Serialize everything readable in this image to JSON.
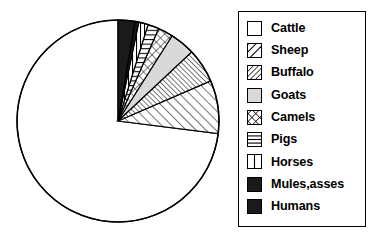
{
  "chart_data": {
    "type": "pie",
    "title": "",
    "subtitle": "",
    "xlabel": "",
    "ylabel": "",
    "grid": false,
    "legend_position": "right",
    "start_angle_deg": 90,
    "direction": "counterclockwise",
    "categories": [
      "Cattle",
      "Sheep",
      "Buffalo",
      "Goats",
      "Camels",
      "Pigs",
      "Horses",
      "Mules,asses",
      "Humans"
    ],
    "values": [
      73.0,
      8.5,
      5.5,
      4.0,
      2.4,
      1.8,
      1.5,
      0.6,
      2.7
    ],
    "units": "percent",
    "slices": [
      {
        "label": "Cattle",
        "value": 73.0,
        "pattern": "blank",
        "fill": "#ffffff",
        "start_deg": 90.0,
        "end_deg": -172.8
      },
      {
        "label": "Sheep",
        "value": 8.5,
        "pattern": "diagonal-wide",
        "fill": "#ffffff",
        "start_deg": 187.2,
        "end_deg": 156.6
      },
      {
        "label": "Buffalo",
        "value": 5.5,
        "pattern": "diagonal-dense",
        "fill": "#ffffff",
        "start_deg": 156.6,
        "end_deg": 136.8
      },
      {
        "label": "Goats",
        "value": 4.0,
        "pattern": "solid-gray",
        "fill": "#d9d9d9",
        "start_deg": 136.8,
        "end_deg": 122.4
      },
      {
        "label": "Camels",
        "value": 2.4,
        "pattern": "crosshatch",
        "fill": "#ffffff",
        "start_deg": 122.4,
        "end_deg": 113.8
      },
      {
        "label": "Pigs",
        "value": 1.8,
        "pattern": "horizontal",
        "fill": "#ffffff",
        "start_deg": 113.8,
        "end_deg": 107.3
      },
      {
        "label": "Horses",
        "value": 1.5,
        "pattern": "vertical",
        "fill": "#ffffff",
        "start_deg": 107.3,
        "end_deg": 101.9
      },
      {
        "label": "Mules,asses",
        "value": 0.6,
        "pattern": "solid-black",
        "fill": "#ffffff",
        "start_deg": 101.9,
        "end_deg": 99.7
      },
      {
        "label": "Humans",
        "value": 2.7,
        "pattern": "solid-black",
        "fill": "#1a1a1a",
        "start_deg": 99.7,
        "end_deg": 90.0
      }
    ]
  },
  "legend": {
    "items": [
      {
        "label": "Cattle",
        "swatch": "swatch-blank"
      },
      {
        "label": "Sheep",
        "swatch": "swatch-diagonal-wide"
      },
      {
        "label": "Buffalo",
        "swatch": "swatch-diagonal-dense"
      },
      {
        "label": "Goats",
        "swatch": "swatch-solid-gray"
      },
      {
        "label": "Camels",
        "swatch": "swatch-crosshatch"
      },
      {
        "label": "Pigs",
        "swatch": "swatch-horizontal"
      },
      {
        "label": "Horses",
        "swatch": "swatch-vertical"
      },
      {
        "label": "Mules,asses",
        "swatch": "swatch-solid-black"
      },
      {
        "label": "Humans",
        "swatch": "swatch-solid-black"
      }
    ]
  },
  "colors": {
    "outline": "#000000",
    "background": "#ffffff",
    "gray_fill": "#d9d9d9",
    "black_fill": "#1a1a1a"
  }
}
